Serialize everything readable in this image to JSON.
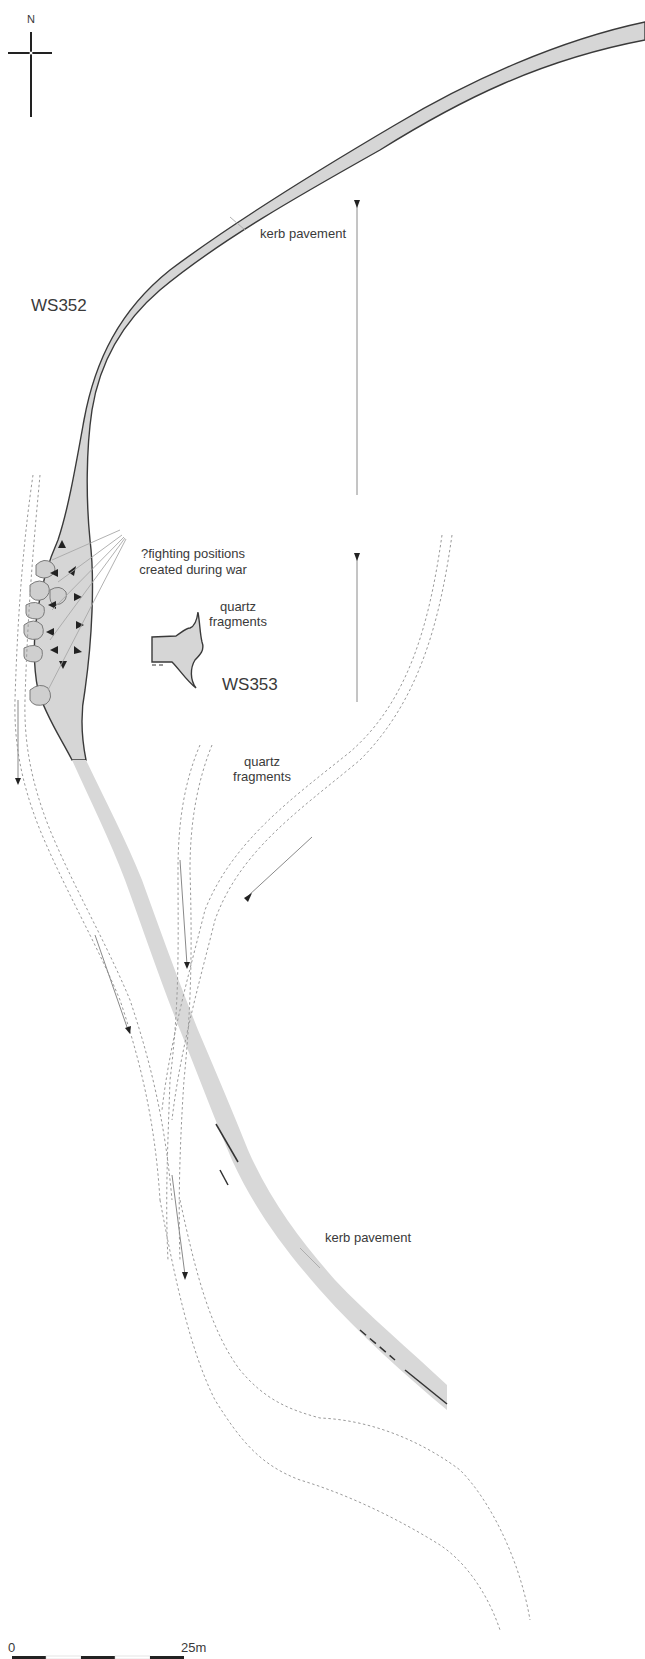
{
  "map": {
    "north_arrow": {
      "label": "N"
    },
    "sites": [
      {
        "id": "ws352",
        "label": "WS352"
      },
      {
        "id": "ws353",
        "label": "WS353"
      }
    ],
    "annotations": {
      "kerb_pavement_north": "kerb pavement",
      "kerb_pavement_south": "kerb pavement",
      "fighting_positions_line1": "?fighting positions",
      "fighting_positions_line2": "created during war",
      "quartz_upper_line1": "quartz",
      "quartz_upper_line2": "fragments",
      "quartz_lower_line1": "quartz",
      "quartz_lower_line2": "fragments"
    },
    "scale_bar": {
      "start_label": "0",
      "end_label": "25m",
      "segments": 5
    },
    "colors": {
      "pavement_fill": "#d6d6d6",
      "outline": "#3a3a3a",
      "track_dotted": "#9a9a9a",
      "text": "#3a3a3a"
    }
  }
}
